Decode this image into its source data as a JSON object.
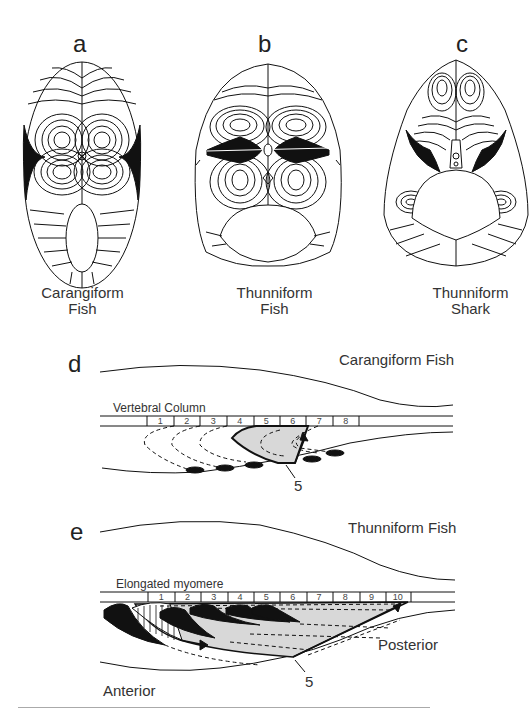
{
  "panels": {
    "a": {
      "letter": "a",
      "caption_line1": "Carangiform",
      "caption_line2": "Fish"
    },
    "b": {
      "letter": "b",
      "caption_line1": "Thunniform",
      "caption_line2": "Fish"
    },
    "c": {
      "letter": "c",
      "caption_line1": "Thunniform",
      "caption_line2": "Shark"
    },
    "d": {
      "letter": "d",
      "title": "Carangiform Fish",
      "column_label": "Vertebral Column",
      "segments": [
        "1",
        "2",
        "3",
        "4",
        "5",
        "6",
        "7",
        "8"
      ],
      "pointer_label": "5"
    },
    "e": {
      "letter": "e",
      "title": "Thunniform Fish",
      "column_label": "Elongated myomere",
      "segments": [
        "1",
        "2",
        "3",
        "4",
        "5",
        "6",
        "7",
        "8",
        "9",
        "10"
      ],
      "pointer_label": "5",
      "anterior_label": "Anterior",
      "posterior_label": "Posterior"
    }
  },
  "colors": {
    "ink": "#111111",
    "fill_gray": "#d8d8d8",
    "rule": "#aaaaaa"
  }
}
